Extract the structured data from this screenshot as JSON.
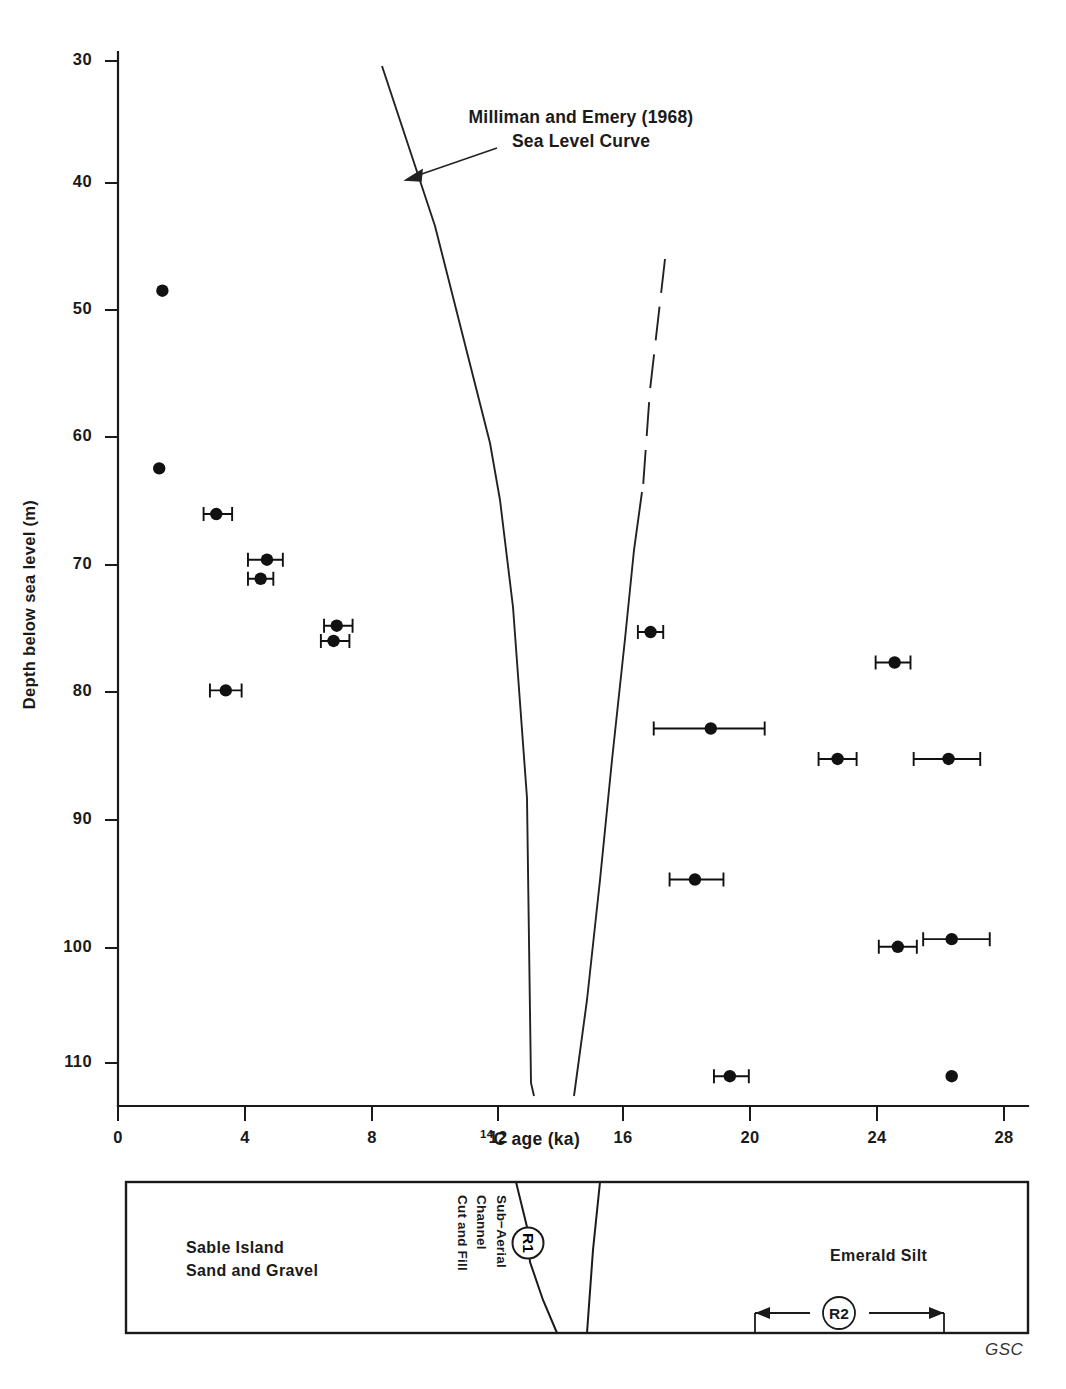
{
  "figure": {
    "credit": "GSC",
    "annotation": {
      "line1": "Milliman and Emery (1968)",
      "line2": "Sea Level Curve",
      "name": "sea-level-curve-annotation"
    }
  },
  "axes": {
    "x": {
      "title_prefix": "14",
      "title_rest": "C age (ka)",
      "title_full": "14C age (ka)",
      "ticks": [
        "0",
        "4",
        "8",
        "12",
        "16",
        "20",
        "24",
        "28"
      ],
      "tick_values": [
        0,
        4,
        8,
        12,
        16,
        20,
        24,
        28
      ],
      "min": 0,
      "max": 29,
      "px_min": 118,
      "px_per_unit": 31.7
    },
    "y": {
      "title": "Depth below sea level (m)",
      "ticks": [
        "30",
        "40",
        "50",
        "60",
        "70",
        "80",
        "90",
        "100",
        "110"
      ],
      "tick_values": [
        30,
        40,
        50,
        60,
        70,
        80,
        90,
        100,
        110
      ],
      "min": 27.5,
      "max": 113.5,
      "px_min": 30,
      "px_top": 61,
      "px_per_unit": 12.69
    }
  },
  "chart_data": {
    "type": "scatter",
    "title": "",
    "xlabel": "14C age (ka)",
    "ylabel": "Depth below sea level (m)",
    "xlim": [
      0,
      29
    ],
    "ylim": [
      113.5,
      27.5
    ],
    "y_inverted": true,
    "grid": false,
    "legend": "none",
    "annotations": [
      {
        "text": "Milliman and Emery (1968) Sea Level Curve",
        "x": 11.0,
        "y": 35.0,
        "arrow_to": {
          "x": 9.4,
          "y": 40.6
        }
      }
    ],
    "series": [
      {
        "name": "Radiocarbon dated samples",
        "marker": "filled-circle",
        "color": "#111111",
        "x_error": "horizontal 1-sigma bars",
        "points": [
          {
            "x": 1.4,
            "y": 48.1,
            "xerr_low": 1.4,
            "xerr_high": 1.4
          },
          {
            "x": 1.3,
            "y": 62.1,
            "xerr_low": 1.3,
            "xerr_high": 1.3
          },
          {
            "x": 3.1,
            "y": 65.7,
            "xerr_low": 2.7,
            "xerr_high": 3.6
          },
          {
            "x": 4.7,
            "y": 69.3,
            "xerr_low": 4.1,
            "xerr_high": 5.2
          },
          {
            "x": 4.5,
            "y": 70.8,
            "xerr_low": 4.1,
            "xerr_high": 4.9
          },
          {
            "x": 6.9,
            "y": 74.5,
            "xerr_low": 6.5,
            "xerr_high": 7.4
          },
          {
            "x": 6.8,
            "y": 75.7,
            "xerr_low": 6.4,
            "xerr_high": 7.3
          },
          {
            "x": 3.4,
            "y": 79.6,
            "xerr_low": 2.9,
            "xerr_high": 3.9
          },
          {
            "x": 16.8,
            "y": 75.0,
            "xerr_low": 16.4,
            "xerr_high": 17.2
          },
          {
            "x": 24.5,
            "y": 77.4,
            "xerr_low": 23.9,
            "xerr_high": 25.0
          },
          {
            "x": 18.7,
            "y": 82.6,
            "xerr_low": 16.9,
            "xerr_high": 20.4
          },
          {
            "x": 22.7,
            "y": 85.0,
            "xerr_low": 22.1,
            "xerr_high": 23.3
          },
          {
            "x": 26.2,
            "y": 85.0,
            "xerr_low": 25.1,
            "xerr_high": 27.2
          },
          {
            "x": 18.2,
            "y": 94.5,
            "xerr_low": 17.4,
            "xerr_high": 19.1
          },
          {
            "x": 24.6,
            "y": 99.8,
            "xerr_low": 24.0,
            "xerr_high": 25.2
          },
          {
            "x": 26.3,
            "y": 99.2,
            "xerr_low": 25.4,
            "xerr_high": 27.5
          },
          {
            "x": 19.3,
            "y": 110.0,
            "xerr_low": 18.8,
            "xerr_high": 19.9
          },
          {
            "x": 26.3,
            "y": 110.0,
            "xerr_low": 26.3,
            "xerr_high": 26.3
          }
        ]
      },
      {
        "name": "Milliman and Emery (1968) Sea Level Curve",
        "marker": "none",
        "style": "solid-with-dashed-upper-right-limb",
        "color": "#222222",
        "left_limb": [
          {
            "x": 8.32,
            "y": 30.3
          },
          {
            "x": 11.7,
            "y": 70.0
          },
          {
            "x": 13.0,
            "y": 91.7
          },
          {
            "x": 13.05,
            "y": 109.0
          },
          {
            "x": 13.6,
            "y": 113.0
          }
        ],
        "right_limb_dashed": [
          {
            "x": 17.25,
            "y": 45.6
          },
          {
            "x": 16.5,
            "y": 61.5
          },
          {
            "x": 16.24,
            "y": 64.0
          }
        ],
        "right_limb_solid": [
          {
            "x": 16.52,
            "y": 61.5
          },
          {
            "x": 15.97,
            "y": 73.6
          },
          {
            "x": 15.1,
            "y": 91.7
          },
          {
            "x": 14.4,
            "y": 110.0
          },
          {
            "x": 14.35,
            "y": 113.0
          }
        ]
      }
    ]
  },
  "strat_panel": {
    "name": "stratigraphic-panel",
    "units": [
      {
        "id": "sable-island",
        "label": "Sable Island\nSand and Gravel"
      },
      {
        "id": "sub-aerial-channel",
        "label": "Sub−Aerial Channel\nCut and Fill"
      },
      {
        "id": "emerald-silt",
        "label": "Emerald Silt"
      }
    ],
    "reflectors": [
      {
        "id": "R1",
        "label": "R1",
        "type": "circle-marker"
      },
      {
        "id": "R2",
        "label": "R2",
        "type": "double-arrow-range",
        "x_start": 20.0,
        "x_end": 26.0
      }
    ]
  }
}
